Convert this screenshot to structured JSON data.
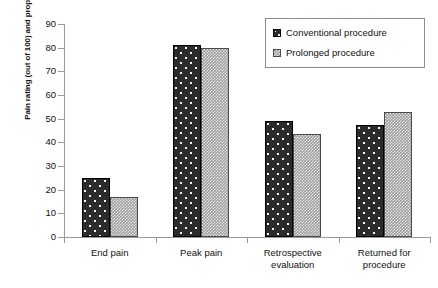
{
  "chart_data": {
    "type": "bar",
    "title": "",
    "xlabel": "",
    "ylabel": "Pain rating (out of 100) and proportion who return (%)",
    "ylim": [
      0,
      90
    ],
    "ytick_labels": [
      "0",
      "10",
      "20",
      "30",
      "40",
      "50",
      "60",
      "70",
      "80",
      "90"
    ],
    "ytick_values": [
      0,
      10,
      20,
      30,
      40,
      50,
      60,
      70,
      80,
      90
    ],
    "grid": false,
    "legend_position": "top-right",
    "categories": [
      "End pain",
      "Peak pain",
      "Retrospective evaluation",
      "Returned for procedure"
    ],
    "series": [
      {
        "name": "Conventional procedure",
        "color": "#2b2b2b",
        "pattern": "dotted",
        "values": [
          25,
          81,
          49,
          47.5
        ]
      },
      {
        "name": "Prolonged procedure",
        "color": "#9b9b9b",
        "pattern": "checkered",
        "values": [
          17,
          80,
          43.5,
          53
        ]
      }
    ]
  },
  "legend": {
    "items": [
      {
        "label": "Conventional procedure"
      },
      {
        "label": "Prolonged procedure"
      }
    ]
  },
  "category_lines": [
    [
      "End pain"
    ],
    [
      "Peak pain"
    ],
    [
      "Retrospective",
      "evaluation"
    ],
    [
      "Returned for",
      "procedure"
    ]
  ]
}
